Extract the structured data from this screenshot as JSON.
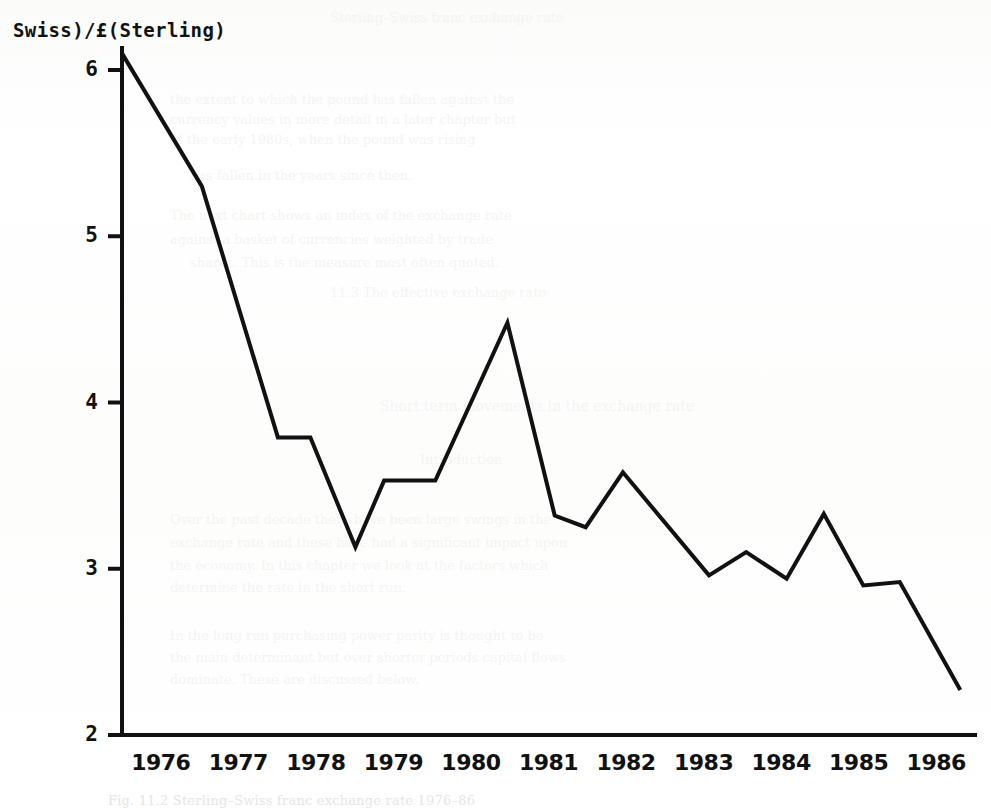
{
  "figure": {
    "y_axis_caption": "Swiss)/£(Sterling)",
    "caption": "Fig. 11.2 Sterling–Swiss franc exchange rate 1976–86",
    "ink_color": "#111111",
    "paper_color": "#ffffff"
  },
  "chart_data": {
    "type": "line",
    "title": "",
    "subtitle": "",
    "xlabel": "",
    "ylabel": "Swiss)/£(Sterling)",
    "xlim": [
      1975.5,
      1986.5
    ],
    "ylim": [
      2,
      6.2
    ],
    "yticks": [
      6,
      5,
      4,
      3,
      2
    ],
    "ytick_labels": [
      "6",
      "5",
      "4",
      "3",
      "2"
    ],
    "xticks": [
      1976,
      1977,
      1978,
      1979,
      1980,
      1981,
      1982,
      1983,
      1984,
      1985,
      1986
    ],
    "xtick_labels": [
      "1976",
      "1977",
      "1978",
      "1979",
      "1980",
      "1981",
      "1982",
      "1983",
      "1984",
      "1985",
      "1986"
    ],
    "grid": false,
    "legend": false,
    "legend_position": "none",
    "series": [
      {
        "name": "Swiss franc per pound sterling",
        "color": "#111111",
        "line_width": 4,
        "markers": false,
        "x": [
          1975.5,
          1976.53,
          1977.51,
          1977.93,
          1978.51,
          1978.88,
          1979.54,
          1980.47,
          1981.08,
          1981.48,
          1981.96,
          1983.07,
          1983.55,
          1984.07,
          1984.55,
          1985.06,
          1985.53,
          1986.31
        ],
        "y": [
          6.1,
          5.3,
          3.79,
          3.79,
          3.13,
          3.53,
          3.53,
          4.48,
          3.32,
          3.25,
          3.58,
          2.96,
          3.1,
          2.94,
          3.33,
          2.9,
          2.92,
          2.27
        ]
      }
    ],
    "annotations": []
  },
  "ghost_text": {
    "lines": [
      {
        "text": "Sterling–Swiss franc exchange rate",
        "x": 330,
        "y": 10,
        "size": 13
      },
      {
        "text": "the extent to which the pound has fallen against the",
        "x": 170,
        "y": 92,
        "size": 13
      },
      {
        "text": "currency values in more detail in a later chapter but",
        "x": 170,
        "y": 112,
        "size": 13
      },
      {
        "text": "of the early 1980s, when the pound was rising",
        "x": 170,
        "y": 132,
        "size": 13
      },
      {
        "text": "has fallen in the years since then.",
        "x": 190,
        "y": 168,
        "size": 13
      },
      {
        "text": "The next chart shows an index of the exchange rate",
        "x": 170,
        "y": 208,
        "size": 13
      },
      {
        "text": "against a basket of currencies weighted by trade",
        "x": 170,
        "y": 232,
        "size": 13
      },
      {
        "text": "shares. This is the measure most often quoted.",
        "x": 190,
        "y": 255,
        "size": 13
      },
      {
        "text": "11.3  The effective exchange rate",
        "x": 330,
        "y": 285,
        "size": 13
      },
      {
        "text": "Short term movements in the exchange rate",
        "x": 380,
        "y": 398,
        "size": 14
      },
      {
        "text": "Introduction",
        "x": 420,
        "y": 452,
        "size": 13
      },
      {
        "text": "Over the past decade there have been large swings in the",
        "x": 170,
        "y": 512,
        "size": 13
      },
      {
        "text": "exchange rate and these have had a significant impact upon",
        "x": 170,
        "y": 535,
        "size": 13
      },
      {
        "text": "the economy. In this chapter we look at the factors which",
        "x": 170,
        "y": 558,
        "size": 13
      },
      {
        "text": "determine the rate in the short run.",
        "x": 170,
        "y": 580,
        "size": 13
      },
      {
        "text": "In the long run purchasing power parity is thought to be",
        "x": 170,
        "y": 628,
        "size": 13
      },
      {
        "text": "the main determinant but over shorter periods capital flows",
        "x": 170,
        "y": 650,
        "size": 13
      },
      {
        "text": "dominate. These are discussed below.",
        "x": 170,
        "y": 672,
        "size": 13
      }
    ]
  }
}
